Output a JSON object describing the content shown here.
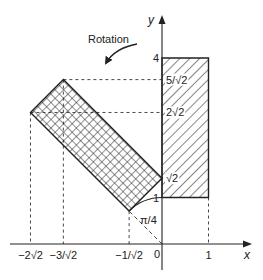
{
  "diagram": {
    "rotation_label": "Rotation",
    "axes": {
      "x_label": "x",
      "y_label": "y",
      "origin_label": "0"
    },
    "x_ticks": [
      {
        "label": "−2√2",
        "value": -2.8284
      },
      {
        "label": "−3/√2",
        "value": -2.1213
      },
      {
        "label": "−1/√2",
        "value": -0.7071
      },
      {
        "label": "1",
        "value": 1
      }
    ],
    "y_ticks": [
      {
        "label": "4",
        "value": 4,
        "side": "left"
      },
      {
        "label": "5/√2",
        "value": 3.5355,
        "side": "right"
      },
      {
        "label": "2√2",
        "value": 2.8284,
        "side": "right"
      },
      {
        "label": "√2",
        "value": 1.4142,
        "side": "right"
      },
      {
        "label": "1",
        "value": 1,
        "side": "left"
      }
    ],
    "angle_label": "π/4",
    "original_rectangle": {
      "name": "hatched rectangle",
      "corners": [
        [
          0,
          1
        ],
        [
          1,
          1
        ],
        [
          1,
          4
        ],
        [
          0,
          4
        ]
      ],
      "fill": "diagonal-hatch"
    },
    "rotated_rectangle": {
      "name": "crosshatched rectangle",
      "corners": [
        [
          -0.7071,
          0.7071
        ],
        [
          0,
          1.4142
        ],
        [
          -2.1213,
          3.5355
        ],
        [
          -2.8284,
          2.8284
        ]
      ],
      "fill": "crosshatch"
    },
    "colors": {
      "ink": "#222222",
      "background": "#ffffff"
    }
  }
}
